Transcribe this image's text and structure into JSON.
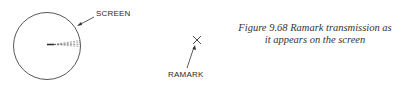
{
  "diagram": {
    "screen_label": "SCREEN",
    "ramark_label": "RAMARK",
    "caption": {
      "line1": "Figure  9.68  Ramark  transmission  as",
      "line2": "it appears on the screen"
    },
    "colors": {
      "ink": "#333333",
      "background": "#ffffff"
    }
  }
}
